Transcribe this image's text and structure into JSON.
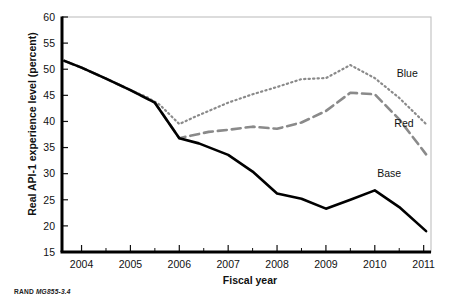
{
  "credit": {
    "org": "RAND",
    "id": "MG855-3.4"
  },
  "chart_data": {
    "type": "line",
    "title": "",
    "xlabel": "Fiscal year",
    "ylabel": "Real API-1 experience level (percent)",
    "xlim": [
      2003.6,
      2011.15
    ],
    "ylim": [
      15,
      60
    ],
    "yticks": [
      15,
      20,
      25,
      30,
      35,
      40,
      45,
      50,
      55,
      60
    ],
    "ytick_labels": [
      "15",
      "20",
      "25",
      "30",
      "35",
      "40",
      "45",
      "50",
      "55",
      "60"
    ],
    "xticks": [
      2004,
      2005,
      2006,
      2007,
      2008,
      2009,
      2010,
      2011
    ],
    "xtick_labels": [
      "2004",
      "2005",
      "2006",
      "2007",
      "2008",
      "2009",
      "2010",
      "2011"
    ],
    "x_minor_ticks": [
      2003.5,
      2004.5,
      2005.5,
      2006.5,
      2007.5,
      2008.5,
      2009.5,
      2010.5
    ],
    "grid": false,
    "legend_position": "inline-right-annotations",
    "series": [
      {
        "name": "Blue",
        "label": "Blue",
        "color": "#8a8a8a",
        "style": "dotted",
        "x": [
          2003.65,
          2004.0,
          2004.5,
          2005.0,
          2005.35,
          2005.6,
          2006.0,
          2006.3,
          2006.6,
          2007.0,
          2007.5,
          2008.0,
          2008.5,
          2009.0,
          2009.5,
          2010.0,
          2010.5,
          2011.05
        ],
        "y": [
          51.6,
          50.3,
          48.2,
          46.0,
          44.6,
          43.2,
          39.5,
          40.8,
          42.0,
          43.6,
          45.2,
          46.6,
          48.1,
          48.3,
          50.8,
          48.3,
          44.5,
          39.5
        ]
      },
      {
        "name": "Red",
        "label": "Red",
        "color": "#8a8a8a",
        "style": "dashed",
        "x": [
          2003.65,
          2004.0,
          2004.5,
          2005.0,
          2005.5,
          2006.0,
          2006.3,
          2006.6,
          2007.0,
          2007.5,
          2008.0,
          2008.5,
          2009.0,
          2009.5,
          2010.0,
          2010.5,
          2011.05
        ],
        "y": [
          51.6,
          50.3,
          48.2,
          46.0,
          43.6,
          36.8,
          37.4,
          38.0,
          38.4,
          39.0,
          38.6,
          39.8,
          42.0,
          45.5,
          45.2,
          40.4,
          33.7
        ]
      },
      {
        "name": "Base",
        "label": "Base",
        "color": "#000000",
        "style": "solid",
        "x": [
          2003.65,
          2004.0,
          2004.5,
          2005.0,
          2005.5,
          2006.0,
          2006.4,
          2007.0,
          2007.5,
          2008.0,
          2008.5,
          2009.0,
          2009.5,
          2010.0,
          2010.5,
          2011.05
        ],
        "y": [
          51.6,
          50.3,
          48.2,
          46.0,
          43.6,
          36.8,
          35.8,
          33.6,
          30.4,
          26.2,
          25.2,
          23.3,
          25.0,
          26.8,
          23.6,
          19.0
        ]
      }
    ],
    "annotations": [
      {
        "text": "Blue",
        "x": 2010.45,
        "y": 48.6
      },
      {
        "text": "Red",
        "x": 2010.4,
        "y": 38.9
      },
      {
        "text": "Base",
        "x": 2010.05,
        "y": 29.3
      }
    ]
  }
}
